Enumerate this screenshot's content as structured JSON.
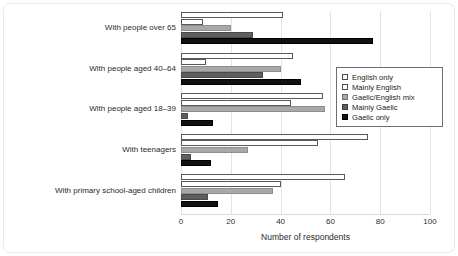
{
  "chart_data": {
    "type": "bar",
    "orientation": "horizontal",
    "title": "",
    "xlabel": "Number of respondents",
    "ylabel": "",
    "xlim": [
      0,
      100
    ],
    "xticks": [
      0,
      20,
      40,
      60,
      80,
      100
    ],
    "grid": true,
    "legend_position": "center-right",
    "categories": [
      "With people over 65",
      "With people aged 40–64",
      "With people aged 18–39",
      "With teenagers",
      "With primary school-aged children"
    ],
    "series": [
      {
        "name": "English only",
        "color": "#ffffff",
        "values": [
          41,
          45,
          57,
          75,
          66
        ]
      },
      {
        "name": "Mainly English",
        "color": "#ffffff",
        "values": [
          9,
          10,
          44,
          55,
          40
        ]
      },
      {
        "name": "Gaelic/English mix",
        "color": "#a8a8a8",
        "values": [
          20,
          40,
          58,
          27,
          37
        ]
      },
      {
        "name": "Mainly Gaelic",
        "color": "#5e5e5e",
        "values": [
          29,
          33,
          3,
          4,
          11
        ]
      },
      {
        "name": "Gaelic only",
        "color": "#111111",
        "values": [
          77,
          48,
          13,
          12,
          15
        ]
      }
    ]
  },
  "legend": {
    "items": [
      "English only",
      "Mainly English",
      "Gaelic/English mix",
      "Mainly Gaelic",
      "Gaelic only"
    ]
  },
  "axis": {
    "tick_labels": [
      "0",
      "20",
      "40",
      "60",
      "80",
      "100"
    ],
    "x_title": "Number of respondents"
  }
}
